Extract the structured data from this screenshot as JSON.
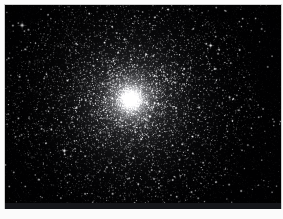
{
  "image": {
    "kind": "astrophoto",
    "subject": "globular-star-cluster",
    "title": "",
    "caption": "",
    "palette": "monochrome-grayscale",
    "background_color": "#010102",
    "star_color": "#ffffff",
    "frame_color": "#fbfbfb",
    "border_color": "#cfcfcf",
    "bottom_strip_color": "#15161a"
  },
  "frame": {
    "stage_width": 283,
    "stage_height": 219,
    "photo_left": 5,
    "photo_top": 5,
    "photo_width": 276,
    "photo_height": 203
  },
  "scene": {
    "cluster": {
      "center_x": 0.455,
      "center_y": 0.465,
      "core_radius": 0.055,
      "halo_radius": 0.42,
      "core_brightness": 1.0,
      "halo_brightness": 0.42,
      "member_star_count": 9000,
      "core_concentration": 2.35
    },
    "field": {
      "field_star_count": 1200,
      "faint_noise_count": 7000,
      "noise_brightness": 0.16
    },
    "bright_stars": [
      {
        "x": 0.062,
        "y": 0.1,
        "r": 2.6,
        "b": 1.0
      },
      {
        "x": 0.085,
        "y": 0.122,
        "r": 1.7,
        "b": 0.85
      },
      {
        "x": 0.305,
        "y": 0.042,
        "r": 1.5,
        "b": 0.8
      },
      {
        "x": 0.47,
        "y": 0.055,
        "r": 1.4,
        "b": 0.78
      },
      {
        "x": 0.745,
        "y": 0.2,
        "r": 2.1,
        "b": 0.95
      },
      {
        "x": 0.772,
        "y": 0.24,
        "r": 1.6,
        "b": 0.82
      },
      {
        "x": 0.93,
        "y": 0.118,
        "r": 1.6,
        "b": 0.8
      },
      {
        "x": 0.952,
        "y": 0.305,
        "r": 1.5,
        "b": 0.76
      },
      {
        "x": 0.215,
        "y": 0.718,
        "r": 2.3,
        "b": 0.97
      },
      {
        "x": 0.238,
        "y": 0.745,
        "r": 1.5,
        "b": 0.78
      },
      {
        "x": 0.06,
        "y": 0.64,
        "r": 1.5,
        "b": 0.76
      },
      {
        "x": 0.122,
        "y": 0.86,
        "r": 1.7,
        "b": 0.84
      },
      {
        "x": 0.39,
        "y": 0.93,
        "r": 1.7,
        "b": 0.86
      },
      {
        "x": 0.56,
        "y": 0.82,
        "r": 1.6,
        "b": 0.8
      },
      {
        "x": 0.632,
        "y": 0.762,
        "r": 1.5,
        "b": 0.78
      },
      {
        "x": 0.7,
        "y": 0.952,
        "r": 1.5,
        "b": 0.78
      },
      {
        "x": 0.812,
        "y": 0.885,
        "r": 1.6,
        "b": 0.82
      },
      {
        "x": 0.88,
        "y": 0.69,
        "r": 1.5,
        "b": 0.76
      },
      {
        "x": 0.975,
        "y": 0.575,
        "r": 1.4,
        "b": 0.74
      },
      {
        "x": 0.345,
        "y": 0.63,
        "r": 1.6,
        "b": 0.8
      },
      {
        "x": 0.468,
        "y": 0.215,
        "r": 1.4,
        "b": 0.74
      },
      {
        "x": 0.15,
        "y": 0.34,
        "r": 1.5,
        "b": 0.78
      },
      {
        "x": 0.205,
        "y": 0.455,
        "r": 1.4,
        "b": 0.74
      },
      {
        "x": 0.66,
        "y": 0.37,
        "r": 1.4,
        "b": 0.74
      },
      {
        "x": 0.84,
        "y": 0.445,
        "r": 1.4,
        "b": 0.72
      }
    ]
  }
}
